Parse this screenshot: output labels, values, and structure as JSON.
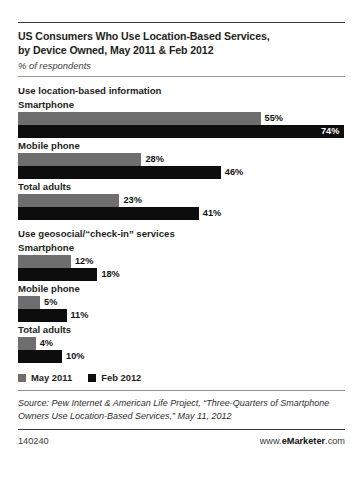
{
  "chart_data": {
    "type": "bar",
    "title": "US Consumers Who Use Location-Based Services, by Device Owned, May 2011 & Feb 2012",
    "title_line1": "US Consumers Who Use Location-Based Services,",
    "title_line2": "by Device Owned, May 2011 & Feb 2012",
    "subtitle": "% of respondents",
    "xlabel": "",
    "ylabel": "",
    "xlim": [
      0,
      100
    ],
    "grid": false,
    "orientation": "horizontal",
    "legend_position": "bottom-left",
    "series": [
      {
        "name": "May 2011",
        "color": "#6e6e6e"
      },
      {
        "name": "Feb 2012",
        "color": "#0d0d0d"
      }
    ],
    "sections": [
      {
        "heading": "Use location-based information",
        "groups": [
          {
            "label": "Smartphone",
            "bars": [
              {
                "series": "May 2011",
                "value": 55,
                "label": "55%",
                "label_position": "outside"
              },
              {
                "series": "Feb 2012",
                "value": 74,
                "label": "74%",
                "label_position": "inside"
              }
            ]
          },
          {
            "label": "Mobile phone",
            "bars": [
              {
                "series": "May 2011",
                "value": 28,
                "label": "28%",
                "label_position": "outside"
              },
              {
                "series": "Feb 2012",
                "value": 46,
                "label": "46%",
                "label_position": "outside"
              }
            ]
          },
          {
            "label": "Total adults",
            "bars": [
              {
                "series": "May 2011",
                "value": 23,
                "label": "23%",
                "label_position": "outside"
              },
              {
                "series": "Feb 2012",
                "value": 41,
                "label": "41%",
                "label_position": "outside"
              }
            ]
          }
        ]
      },
      {
        "heading": "Use geosocial/“check-in” services",
        "groups": [
          {
            "label": "Smartphone",
            "bars": [
              {
                "series": "May 2011",
                "value": 12,
                "label": "12%",
                "label_position": "outside"
              },
              {
                "series": "Feb 2012",
                "value": 18,
                "label": "18%",
                "label_position": "outside"
              }
            ]
          },
          {
            "label": "Mobile phone",
            "bars": [
              {
                "series": "May 2011",
                "value": 5,
                "label": "5%",
                "label_position": "outside"
              },
              {
                "series": "Feb 2012",
                "value": 11,
                "label": "11%",
                "label_position": "outside"
              }
            ]
          },
          {
            "label": "Total adults",
            "bars": [
              {
                "series": "May 2011",
                "value": 4,
                "label": "4%",
                "label_position": "outside"
              },
              {
                "series": "Feb 2012",
                "value": 10,
                "label": "10%",
                "label_position": "outside"
              }
            ]
          }
        ]
      }
    ],
    "source": "Source: Pew Internet & American Life Project, “Three-Quarters of Smartphone Owners Use Location-Based Services,” May 11, 2012"
  },
  "footer": {
    "id": "140240",
    "brand_prefix": "www.",
    "brand_name": "eMarketer",
    "brand_suffix": ".com"
  }
}
